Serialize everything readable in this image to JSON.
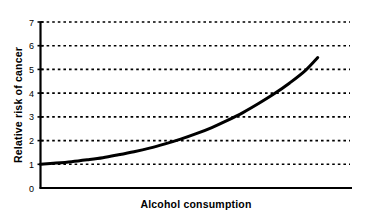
{
  "chart_data": {
    "type": "line",
    "title": "",
    "subtitle": "",
    "xlabel": "Alcohol consumption",
    "ylabel": "Relative risk of cancer",
    "grid": true,
    "grid_style": "dotted-horizontal",
    "legend": null,
    "legend_position": "none",
    "xlim": [
      0,
      1
    ],
    "ylim": [
      0,
      7
    ],
    "x_tick_labels": [],
    "y_tick_labels": [
      "0",
      "1",
      "2",
      "3",
      "4",
      "5",
      "6",
      "7"
    ],
    "y_ticks": [
      0,
      1,
      2,
      3,
      4,
      5,
      6,
      7
    ],
    "series": [
      {
        "name": "Relative risk of cancer",
        "color": "#000000",
        "x": [
          0.0,
          0.05,
          0.1,
          0.15,
          0.2,
          0.25,
          0.3,
          0.35,
          0.4,
          0.45,
          0.5,
          0.55,
          0.6,
          0.65,
          0.7,
          0.75,
          0.8,
          0.85,
          0.89
        ],
        "values": [
          1.0,
          1.05,
          1.11,
          1.19,
          1.28,
          1.4,
          1.53,
          1.68,
          1.86,
          2.06,
          2.29,
          2.55,
          2.85,
          3.18,
          3.56,
          3.97,
          4.43,
          4.95,
          5.5
        ]
      }
    ],
    "annotations": []
  },
  "axes": {
    "y_axis_title": "Relative risk of cancer",
    "x_axis_title": "Alcohol consumption",
    "y_tick_0": "0",
    "y_tick_1": "1",
    "y_tick_2": "2",
    "y_tick_3": "3",
    "y_tick_4": "4",
    "y_tick_5": "5",
    "y_tick_6": "6",
    "y_tick_7": "7"
  },
  "colors": {
    "background": "#ffffff",
    "axis": "#000000",
    "grid": "#000000",
    "curve": "#000000"
  }
}
